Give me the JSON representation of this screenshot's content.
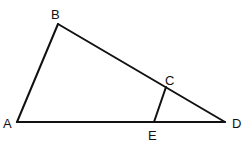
{
  "diagram": {
    "type": "triangle",
    "stroke_color": "#111111",
    "background": "#ffffff",
    "points": {
      "A": {
        "label": "A",
        "x": 17,
        "y": 122
      },
      "B": {
        "label": "B",
        "x": 58,
        "y": 24
      },
      "C": {
        "label": "C",
        "x": 166,
        "y": 87
      },
      "D": {
        "label": "D",
        "x": 225,
        "y": 122
      },
      "E": {
        "label": "E",
        "x": 154,
        "y": 122
      }
    },
    "segments": [
      "AB",
      "BD",
      "AD",
      "CE"
    ]
  }
}
